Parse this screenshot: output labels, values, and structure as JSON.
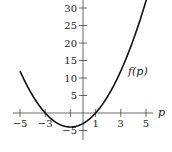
{
  "chart_data": {
    "type": "line",
    "title": "",
    "xlabel": "p",
    "ylabel": "",
    "xlim": [
      -5.5,
      5.5
    ],
    "ylim": [
      -6,
      32
    ],
    "grid": false,
    "x_ticks": [
      -5,
      -3,
      1,
      3,
      5
    ],
    "x_tick_labels": [
      "−5",
      "−3",
      "1",
      "3",
      "5"
    ],
    "y_ticks": [
      -5,
      5,
      10,
      15,
      20,
      25,
      30
    ],
    "y_tick_labels": [
      "−5",
      "5",
      "10",
      "15",
      "20",
      "25",
      "30"
    ],
    "series": [
      {
        "name": "f(p)",
        "formula": "f(p) = p^2 + 2p - 3",
        "x": [
          -5,
          -4,
          -3,
          -2,
          -1,
          0,
          1,
          2,
          3,
          4,
          5
        ],
        "values": [
          12,
          5,
          0,
          -3,
          -4,
          -3,
          0,
          5,
          12,
          21,
          32
        ]
      }
    ],
    "annotations": [
      {
        "text": "f(p)",
        "x": 3.8,
        "y": 13
      }
    ]
  },
  "labels": {
    "axis_var": "p",
    "curve": "f(p)"
  }
}
